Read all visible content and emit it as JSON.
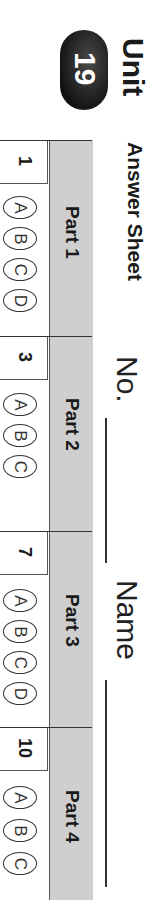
{
  "header": {
    "unit_word": "Unit",
    "unit_number": "19",
    "title": "Answer Sheet",
    "no_label": "No.",
    "name_label": "Name"
  },
  "parts": [
    {
      "label": "Part 1",
      "question": "1",
      "options": [
        "A",
        "B",
        "C",
        "D"
      ]
    },
    {
      "label": "Part 2",
      "question": "3",
      "options": [
        "A",
        "B",
        "C"
      ]
    },
    {
      "label": "Part 3",
      "question": "7",
      "options": [
        "A",
        "B",
        "C",
        "D"
      ]
    },
    {
      "label": "Part 4",
      "question": "10",
      "options": [
        "A",
        "B",
        "C"
      ]
    }
  ],
  "colors": {
    "header_band": "#cfcfcf",
    "badge": "#1a1a1a"
  }
}
